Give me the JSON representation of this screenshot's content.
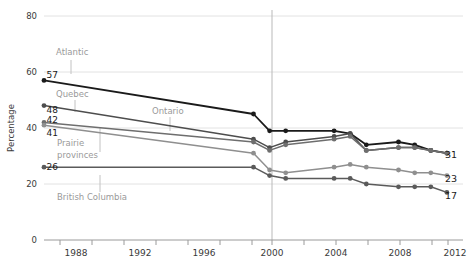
{
  "chart_data": {
    "type": "line",
    "title": "",
    "xlabel": "",
    "ylabel": "Percentage",
    "xlim": [
      1986,
      2012
    ],
    "ylim": [
      0,
      80
    ],
    "yticks": [
      0,
      20,
      40,
      60,
      80
    ],
    "xticks": [
      1988,
      1992,
      1996,
      2000,
      2004,
      2008,
      2012
    ],
    "xminorticks": [
      1986,
      1990,
      1994,
      1998,
      2002,
      2006,
      2010
    ],
    "grid": true,
    "legend_position": "inline-annotations",
    "reference_line_x": 2000,
    "series": [
      {
        "name": "Atlantic",
        "color": "#1a1a1a",
        "start_label": "57",
        "end_label": "31",
        "x": [
          1986,
          1999,
          2000,
          2001,
          2004,
          2005,
          2006,
          2008,
          2009,
          2010,
          2011
        ],
        "values": [
          57,
          45,
          39,
          39,
          39,
          38,
          34,
          35,
          34,
          32,
          31
        ]
      },
      {
        "name": "Quebec",
        "color": "#4d4d4d",
        "start_label": "48",
        "end_label": "31",
        "x": [
          1986,
          1999,
          2000,
          2001,
          2004,
          2005,
          2006,
          2008,
          2009,
          2010,
          2011
        ],
        "values": [
          48,
          36,
          33,
          35,
          37,
          38,
          32,
          33,
          33,
          32,
          31
        ]
      },
      {
        "name": "Ontario",
        "color": "#6e6e6e",
        "start_label": "42",
        "end_label": "31",
        "x": [
          1986,
          1999,
          2000,
          2001,
          2004,
          2005,
          2006,
          2008,
          2009,
          2010,
          2011
        ],
        "values": [
          42,
          35,
          32,
          34,
          36,
          37,
          32,
          33,
          33,
          32,
          31
        ]
      },
      {
        "name": "Prairie provinces",
        "color": "#8f8f8f",
        "start_label": "41",
        "end_label": "23",
        "x": [
          1986,
          1999,
          2000,
          2001,
          2004,
          2005,
          2006,
          2008,
          2009,
          2010,
          2011
        ],
        "values": [
          41,
          31,
          25,
          24,
          26,
          27,
          26,
          25,
          24,
          24,
          23
        ]
      },
      {
        "name": "British Columbia",
        "color": "#5a5a5a",
        "start_label": "26",
        "end_label": "17",
        "x": [
          1986,
          1999,
          2000,
          2001,
          2004,
          2005,
          2006,
          2008,
          2009,
          2010,
          2011
        ],
        "values": [
          26,
          26,
          23,
          22,
          22,
          22,
          20,
          19,
          19,
          19,
          17
        ]
      }
    ],
    "annotations": [
      {
        "text": "Atlantic",
        "x": 56,
        "y": 55,
        "leader_x": 71,
        "leader_y1": 60,
        "leader_y2": 74
      },
      {
        "text": "Quebec",
        "x": 56,
        "y": 97,
        "leader_x": 75,
        "leader_y1": 100,
        "leader_y2": 112
      },
      {
        "text": "Ontario",
        "x": 152,
        "y": 113,
        "leader_x": 170,
        "leader_y1": 117,
        "leader_y2": 131
      },
      {
        "text": "Prairie",
        "x": 57,
        "y": 145,
        "leader_x": 100,
        "leader_y1": 128,
        "leader_y2": 152
      },
      {
        "text": "provinces",
        "x": 57,
        "y": 156,
        "leader_x": 0,
        "leader_y1": 0,
        "leader_y2": 0
      },
      {
        "text": "British Columbia",
        "x": 57,
        "y": 199,
        "leader_x": 100,
        "leader_y1": 175,
        "leader_y2": 192
      }
    ]
  },
  "axis": {
    "ylabel": "Percentage",
    "ytick_labels": [
      "0",
      "20",
      "40",
      "60",
      "80"
    ],
    "xtick_labels": [
      "1988",
      "1992",
      "1996",
      "2000",
      "2004",
      "2008",
      "2012"
    ]
  },
  "start_values": [
    "57",
    "48",
    "42",
    "41",
    "26"
  ],
  "end_values": [
    "31",
    "23",
    "17"
  ],
  "colors": {
    "grid": "#e2e2e2",
    "axis": "#9a9a9a",
    "text": "#3a3a3a",
    "annotation": "#9a9a9a",
    "reference_line": "#b9b9b9"
  }
}
